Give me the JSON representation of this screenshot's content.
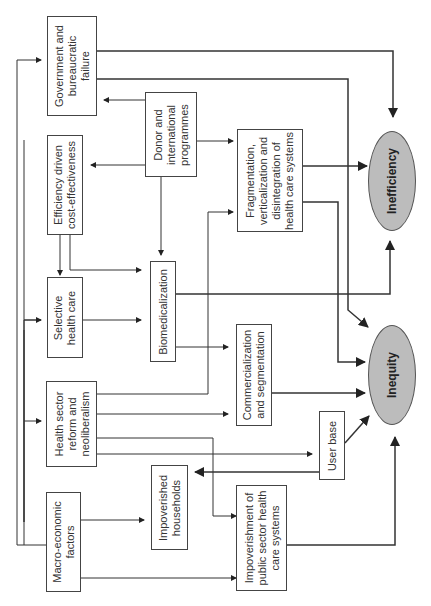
{
  "diagram": {
    "orientation": "rotated-90-ccw",
    "nodes": {
      "government": {
        "label_lines": [
          "Government and",
          "bureaucratic",
          "failure"
        ]
      },
      "donor": {
        "label_lines": [
          "Donor and",
          "international",
          "programmes"
        ]
      },
      "efficiency": {
        "label_lines": [
          "Efficiency driven",
          "cost-effectiveness"
        ]
      },
      "fragmentation": {
        "label_lines": [
          "Fragmentation,",
          "verticalization and",
          "disintegration of",
          "health care systems"
        ]
      },
      "selective": {
        "label_lines": [
          "Selective",
          "health care"
        ]
      },
      "biomedicalization": {
        "label_lines": [
          "Biomedicalization"
        ]
      },
      "health_sector": {
        "label_lines": [
          "Health sector",
          "reform and",
          "neoliberalism"
        ]
      },
      "commercialization": {
        "label_lines": [
          "Commercialization",
          "and segmentation"
        ]
      },
      "user_base": {
        "label_lines": [
          "User base"
        ]
      },
      "macro": {
        "label_lines": [
          "Macro-economic",
          "factors"
        ]
      },
      "impoverished_households": {
        "label_lines": [
          "Impoverished",
          "households"
        ]
      },
      "impoverishment_public": {
        "label_lines": [
          "Impoverishment of",
          "public sector health",
          "care systems"
        ]
      },
      "inefficiency": {
        "label": "Inefficiency"
      },
      "inequity": {
        "label": "Inequity"
      }
    },
    "edges": [
      {
        "from": "Macro-economic factors",
        "to": "Government and bureaucratic failure"
      },
      {
        "from": "Macro-economic factors",
        "to": "Selective health care"
      },
      {
        "from": "Macro-economic factors",
        "to": "Health sector reform and neoliberalism"
      },
      {
        "from": "Macro-economic factors",
        "to": "Impoverished households"
      },
      {
        "from": "Macro-economic factors",
        "to": "Impoverishment of public sector health care systems"
      },
      {
        "from": "Donor and international programmes",
        "to": "Government and bureaucratic failure"
      },
      {
        "from": "Donor and international programmes",
        "to": "Efficiency driven cost-effectiveness"
      },
      {
        "from": "Donor and international programmes",
        "to": "Fragmentation, verticalization and disintegration of health care systems"
      },
      {
        "from": "Donor and international programmes",
        "to": "Biomedicalization"
      },
      {
        "from": "Efficiency driven cost-effectiveness",
        "to": "Selective health care"
      },
      {
        "from": "Efficiency driven cost-effectiveness",
        "to": "Biomedicalization"
      },
      {
        "from": "Selective health care",
        "to": "Biomedicalization"
      },
      {
        "from": "Health sector reform and neoliberalism",
        "to": "Fragmentation, verticalization and disintegration of health care systems"
      },
      {
        "from": "Health sector reform and neoliberalism",
        "to": "Commercialization and segmentation"
      },
      {
        "from": "Health sector reform and neoliberalism",
        "to": "User base"
      },
      {
        "from": "Health sector reform and neoliberalism",
        "to": "Impoverishment of public sector health care systems"
      },
      {
        "from": "Biomedicalization",
        "to": "Commercialization and segmentation"
      },
      {
        "from": "Biomedicalization",
        "to": "Inefficiency"
      },
      {
        "from": "User base",
        "to": "Impoverished households"
      },
      {
        "from": "User base",
        "to": "Inequity"
      },
      {
        "from": "Government and bureaucratic failure",
        "to": "Inefficiency"
      },
      {
        "from": "Government and bureaucratic failure",
        "to": "Inequity"
      },
      {
        "from": "Fragmentation, verticalization and disintegration of health care systems",
        "to": "Inefficiency"
      },
      {
        "from": "Fragmentation, verticalization and disintegration of health care systems",
        "to": "Inequity"
      },
      {
        "from": "Commercialization and segmentation",
        "to": "Inequity"
      },
      {
        "from": "Impoverishment of public sector health care systems",
        "to": "Inequity"
      }
    ]
  }
}
